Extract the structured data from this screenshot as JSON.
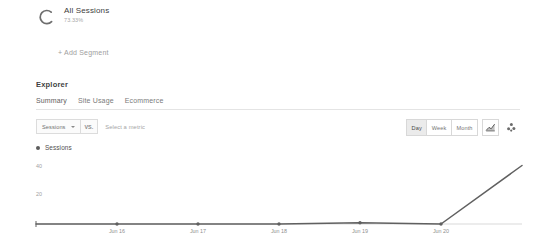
{
  "segment": {
    "icon": "donut-arc-icon",
    "name": "All Sessions",
    "percent": "73.33%"
  },
  "add_segment": {
    "label": "+ Add Segment"
  },
  "explorer": {
    "title": "Explorer",
    "tabs": [
      {
        "label": "Summary",
        "active": true
      },
      {
        "label": "Site Usage",
        "active": false
      },
      {
        "label": "Ecommerce",
        "active": false
      }
    ]
  },
  "metric_selector": {
    "primary_metric": "Sessions",
    "caret_icon": "chevron-down-icon",
    "vs_label": "VS.",
    "secondary_placeholder": "Select a metric"
  },
  "view_controls": {
    "granularity": [
      {
        "label": "Day",
        "active": true
      },
      {
        "label": "Week",
        "active": false
      },
      {
        "label": "Month",
        "active": false
      }
    ],
    "chart_type_buttons": [
      {
        "icon": "line-chart-icon",
        "active": true
      },
      {
        "icon": "scatter-plot-icon",
        "active": false
      }
    ]
  },
  "legend": {
    "items": [
      {
        "label": "Sessions",
        "color": "#5c5c5c"
      }
    ]
  },
  "chart_data": {
    "type": "line",
    "title": "",
    "xlabel": "",
    "ylabel": "",
    "ylim": [
      0,
      50
    ],
    "yticks": [
      20,
      40
    ],
    "ytick_labels": [
      "20",
      "40"
    ],
    "grid": false,
    "legend_position": "top-left",
    "categories": [
      "Jun 15",
      "Jun 16",
      "Jun 17",
      "Jun 18",
      "Jun 19",
      "Jun 20",
      "Jun 21"
    ],
    "tick_labels": [
      "",
      "Jun 16",
      "Jun 17",
      "Jun 18",
      "Jun 19",
      "Jun 20",
      ""
    ],
    "series": [
      {
        "name": "Sessions",
        "color": "#606060",
        "values": [
          0,
          0,
          0,
          0,
          1,
          0,
          45
        ]
      }
    ]
  }
}
